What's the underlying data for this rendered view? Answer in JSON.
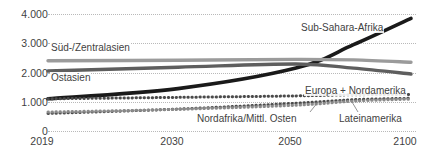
{
  "chart_data": {
    "type": "line",
    "title": "",
    "subtitle": "",
    "xlabel": "",
    "ylabel": "",
    "ylim": [
      0,
      4000
    ],
    "yticks": [
      "0",
      "1.000",
      "2.000",
      "3.000",
      "4.000"
    ],
    "ytick_values": [
      0,
      1000,
      2000,
      3000,
      4000
    ],
    "xticks": [
      "2019",
      "2030",
      "2050",
      "2100"
    ],
    "xtick_values": [
      2019,
      2030,
      2050,
      2100
    ],
    "grid": "horizontal-dotted",
    "legend": "inline-annotations",
    "x": [
      2019,
      2030,
      2050,
      2075,
      2100
    ],
    "series": [
      {
        "name": "Sub-Sahara-Afrika",
        "values": [
          1100,
          1450,
          2150,
          2950,
          3850
        ],
        "color": "#1a1a1a",
        "style": "solid",
        "width": 3.6,
        "label_x": 300,
        "label_y": 22
      },
      {
        "name": "Süd-/Zentralasien",
        "values": [
          2400,
          2420,
          2450,
          2430,
          2350
        ],
        "color": "#9b9b9b",
        "style": "solid",
        "width": 3.4,
        "label_x": 50,
        "label_y": 48
      },
      {
        "name": "Ostasien",
        "values": [
          2050,
          2180,
          2290,
          2150,
          1950
        ],
        "color": "#5e5e5e",
        "style": "solid",
        "width": 3.4,
        "label_x": 50,
        "label_y": 78
      },
      {
        "name": "Europa + Nordamerika",
        "values": [
          1100,
          1150,
          1200,
          1240,
          1250
        ],
        "color": "#4a4a4a",
        "style": "dotted",
        "width": 3.0,
        "label_x": 310,
        "label_y": 88
      },
      {
        "name": "Nordafrika/Mittl. Osten",
        "values": [
          600,
          750,
          950,
          1070,
          1120
        ],
        "color": "#4a4a4a",
        "style": "dotted",
        "width": 3.0,
        "label_x": 200,
        "label_y": 117
      },
      {
        "name": "Lateinamerika",
        "values": [
          650,
          740,
          880,
          1020,
          1090
        ],
        "color": "#8a8a8a",
        "style": "dotted",
        "width": 3.0,
        "label_x": 340,
        "label_y": 117
      }
    ]
  }
}
